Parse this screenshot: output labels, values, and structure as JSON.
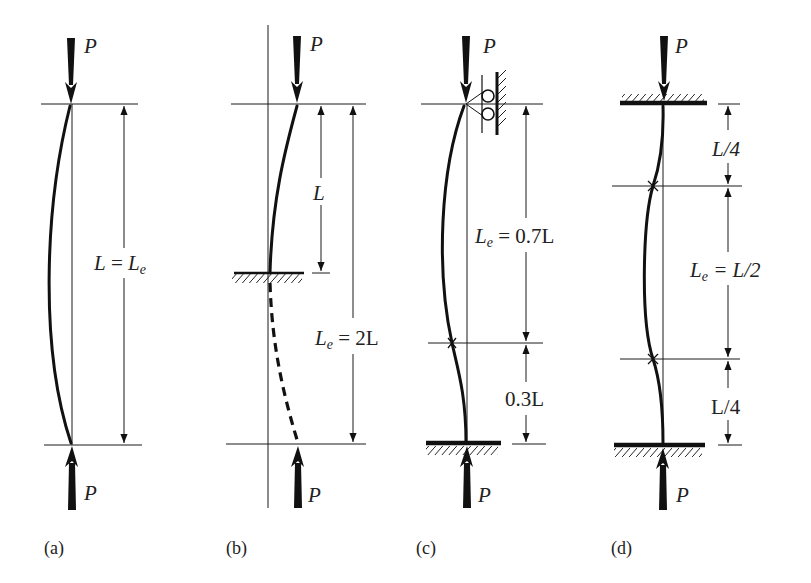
{
  "figure": {
    "load_symbol": "P",
    "panels": [
      {
        "caption": "(a)",
        "end_conditions": "pinned-pinned",
        "labels": {
          "effective_length": "L = L",
          "effective_length_sub": "e"
        }
      },
      {
        "caption": "(b)",
        "end_conditions": "fixed-free",
        "labels": {
          "length": "L",
          "effective_length": "L",
          "effective_length_sub": "e",
          "effective_length_value": " = 2L"
        }
      },
      {
        "caption": "(c)",
        "end_conditions": "fixed-pinned",
        "labels": {
          "effective_length": "L",
          "effective_length_sub": "e",
          "effective_length_value": " = 0.7L",
          "remainder": "0.3L"
        }
      },
      {
        "caption": "(d)",
        "end_conditions": "fixed-fixed",
        "labels": {
          "top_segment": "L/4",
          "effective_length": "L",
          "effective_length_sub": "e",
          "effective_length_value": " = L/2",
          "bottom_segment": "L/4"
        }
      }
    ]
  }
}
